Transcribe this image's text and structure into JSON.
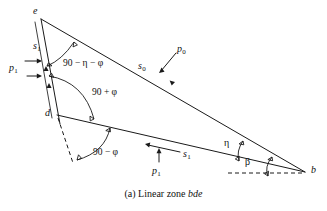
{
  "figure": {
    "caption_prefix": "(a) Linear zone ",
    "caption_zone": "bde",
    "vertices": [
      {
        "id": "e",
        "label": "e",
        "x": 40,
        "y": 18
      },
      {
        "id": "d",
        "label": "d",
        "x": 57,
        "y": 115
      },
      {
        "id": "b",
        "label": "b",
        "x": 305,
        "y": 172
      }
    ],
    "angles": [
      {
        "id": "apex-e",
        "label": "90 − η − φ",
        "at": "e"
      },
      {
        "id": "interior-d-upper",
        "label": "90 + φ",
        "at": "d"
      },
      {
        "id": "interior-d-lower",
        "label": "90 − φ",
        "at": "d"
      },
      {
        "id": "eta-at-b",
        "label": "η",
        "at": "b"
      },
      {
        "id": "beta-at-b",
        "label": "β",
        "at": "b"
      }
    ],
    "forces": [
      {
        "id": "s1-on-ed",
        "symbol": "s",
        "subscript": "1",
        "on": "ed"
      },
      {
        "id": "p1-on-ed",
        "symbol": "p",
        "subscript": "1",
        "on": "ed"
      },
      {
        "id": "s0-on-eb",
        "symbol": "s",
        "subscript": "0",
        "on": "eb"
      },
      {
        "id": "p0-on-eb",
        "symbol": "p",
        "subscript": "0",
        "on": "eb"
      },
      {
        "id": "s1-on-db",
        "symbol": "s",
        "subscript": "1",
        "on": "db"
      },
      {
        "id": "p1-on-db",
        "symbol": "p",
        "subscript": "1",
        "on": "db"
      }
    ],
    "colors": {
      "ink": "#1a1a1a",
      "background": "#ffffff"
    }
  }
}
